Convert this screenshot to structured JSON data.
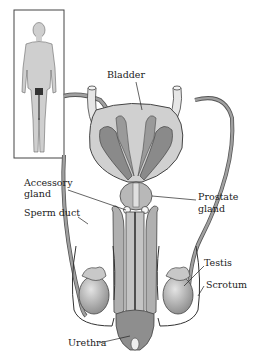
{
  "diagram": {
    "inset": "Full body silhouette showing location of reproductive organs",
    "labels": {
      "bladder": "Bladder",
      "accessory_gland_1": "Accessory",
      "accessory_gland_2": "gland",
      "sperm_duct": "Sperm duct",
      "prostate_1": "Prostate",
      "prostate_2": "gland",
      "testis": "Testis",
      "scrotum": "Scrotum",
      "urethra": "Urethra"
    },
    "colors": {
      "outline": "#3a3a3a",
      "light_fill": "#d4d4d4",
      "mid_fill": "#a8a8a8",
      "dark_fill": "#7a7a7a",
      "background": "#ffffff"
    }
  }
}
